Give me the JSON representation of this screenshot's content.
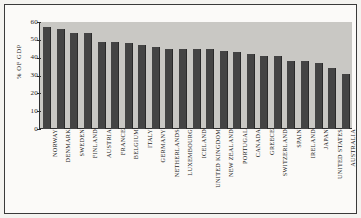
{
  "chart_data": {
    "type": "bar",
    "title": "",
    "xlabel": "",
    "ylabel": "% OF GDP",
    "ylim": [
      0,
      60
    ],
    "yticks": [
      0,
      10,
      20,
      30,
      40,
      50,
      60
    ],
    "ytick_labels": [
      "0",
      "10",
      "20",
      "30",
      "40",
      "50",
      "60"
    ],
    "grid": false,
    "legend": null,
    "categories": [
      "NORWAY",
      "DENMARK",
      "SWEDEN",
      "FINLAND",
      "AUSTRIA",
      "FRANCE",
      "BELGIUM",
      "ITALY",
      "GERMANY",
      "NETHERLANDS",
      "LUXEMBOURG",
      "ICELAND",
      "UNITED KINGDOM",
      "NEW ZEALAND",
      "PORTUGAL",
      "CANADA",
      "GREECE",
      "SWITZERLAND",
      "SPAIN",
      "IRELAND",
      "JAPAN",
      "UNITED STATES",
      "AUSTRALIA"
    ],
    "values": [
      57,
      56,
      54,
      54,
      49,
      49,
      48,
      47,
      46,
      45,
      45,
      45,
      45,
      44,
      43,
      42,
      41,
      41,
      38,
      38,
      37,
      34,
      31
    ],
    "colors": {
      "bar": "#444444",
      "panel": "#c9c8c4",
      "axis": "#2e2e2e",
      "figure": "#fbfaf8",
      "text": "#1c1c1c"
    }
  }
}
